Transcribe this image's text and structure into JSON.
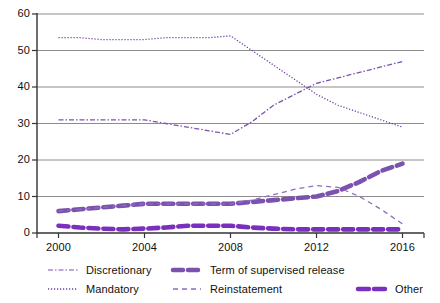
{
  "chart_data": {
    "type": "line",
    "title": "",
    "xlabel": "",
    "ylabel": "",
    "xlim": [
      1999,
      2017
    ],
    "ylim": [
      0,
      60
    ],
    "yticks": [
      0,
      10,
      20,
      30,
      40,
      50,
      60
    ],
    "xticks": [
      2000,
      2004,
      2008,
      2012,
      2016
    ],
    "grid": "horizontal",
    "legend_position": "bottom",
    "x": [
      2000,
      2001,
      2002,
      2003,
      2004,
      2005,
      2006,
      2007,
      2008,
      2009,
      2010,
      2011,
      2012,
      2013,
      2014,
      2015,
      2016
    ],
    "series": [
      {
        "name": "Discretionary",
        "style": "dash-dot",
        "width": "thin",
        "color": "#7B52AE",
        "values": [
          31,
          31,
          31,
          31,
          31,
          30,
          29,
          28,
          27,
          30.5,
          35,
          38,
          41,
          42.5,
          44,
          45.5,
          47
        ]
      },
      {
        "name": "Mandatory",
        "style": "dotted",
        "width": "thin",
        "color": "#6B3FA0",
        "values": [
          53.5,
          53.5,
          53,
          53,
          53,
          53.5,
          53.5,
          53.5,
          54,
          50,
          46,
          42,
          38,
          35,
          33,
          31,
          29
        ]
      },
      {
        "name": "Term of supervised release",
        "style": "dashed",
        "width": "thick",
        "color": "#7B52AE",
        "values": [
          6,
          6.5,
          7,
          7.5,
          8,
          8,
          8,
          8,
          8,
          8.5,
          9,
          9.5,
          10,
          11.5,
          14,
          17,
          19
        ]
      },
      {
        "name": "Reinstatement",
        "style": "dashed",
        "width": "thin",
        "color": "#8E6CC0",
        "values": [
          6,
          6.5,
          7,
          7.5,
          8,
          8,
          8,
          8,
          8,
          9,
          10.5,
          12,
          13,
          12.5,
          10,
          6.5,
          2.5
        ]
      },
      {
        "name": "Other",
        "style": "dashed",
        "width": "thick",
        "color": "#7B2FBE",
        "values": [
          2,
          1.5,
          1.2,
          1,
          1.2,
          1.5,
          2,
          2,
          2,
          1.5,
          1.2,
          1,
          1,
          1,
          1,
          1,
          1
        ]
      }
    ]
  },
  "axis": {
    "y_labels": [
      "60",
      "50",
      "40",
      "30",
      "20",
      "10",
      "0"
    ],
    "x_labels": [
      "2000",
      "2004",
      "2008",
      "2012",
      "2016"
    ]
  },
  "legend": {
    "entries": [
      {
        "label": "Discretionary"
      },
      {
        "label": "Mandatory"
      },
      {
        "label": "Term of supervised release"
      },
      {
        "label": "Reinstatement"
      },
      {
        "label": "Other"
      }
    ]
  },
  "colors": {
    "accent": "#7B52AE",
    "grid": "#8c8c8c",
    "axis": "#333333"
  }
}
